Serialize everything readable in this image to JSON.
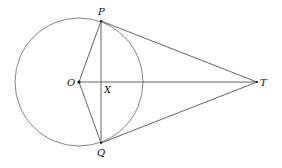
{
  "diagram": {
    "type": "geometry",
    "circle": {
      "center": "O",
      "cx": 79,
      "cy": 82,
      "r": 64,
      "color": "#777777"
    },
    "points": {
      "O": {
        "label": "O",
        "x": 79,
        "y": 82
      },
      "P": {
        "label": "P",
        "x": 101,
        "y": 21
      },
      "Q": {
        "label": "Q",
        "x": 101,
        "y": 143
      },
      "T": {
        "label": "T",
        "x": 257,
        "y": 82
      },
      "X": {
        "label": "X",
        "x": 101,
        "y": 82
      }
    },
    "segments": [
      [
        "O",
        "P"
      ],
      [
        "O",
        "Q"
      ],
      [
        "P",
        "Q"
      ],
      [
        "O",
        "T"
      ],
      [
        "P",
        "T"
      ],
      [
        "Q",
        "T"
      ]
    ],
    "line_color": "#555555"
  }
}
